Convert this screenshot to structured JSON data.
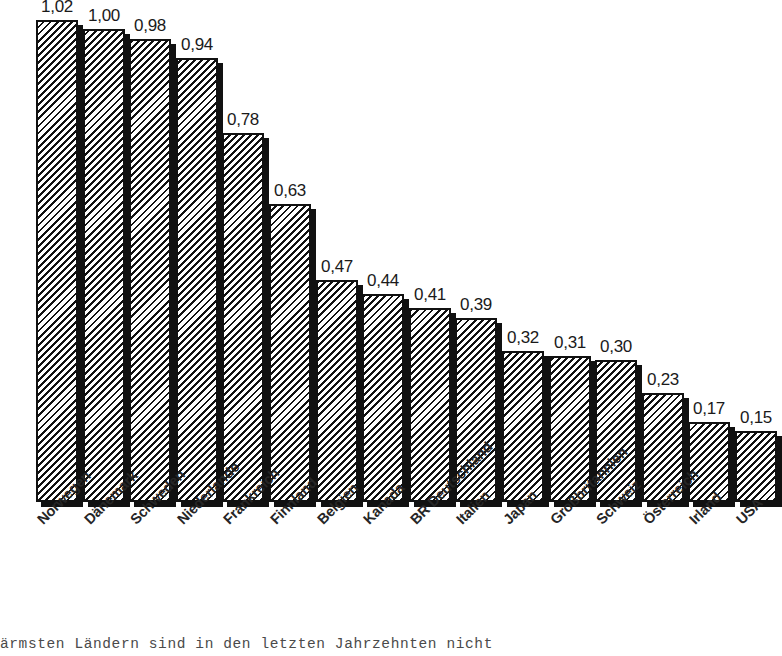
{
  "chart_data": {
    "type": "bar",
    "title": "",
    "subtitle": "",
    "xlabel": "",
    "ylabel": "",
    "ylim": [
      0,
      1.02
    ],
    "grid": false,
    "legend": "none",
    "value_decimal_separator": ",",
    "categories": [
      "Norwegen",
      "Dänemark",
      "Schweden",
      "Niederlande",
      "Frankreich",
      "Finnland",
      "Belgien",
      "Kanada",
      "BR Deutschland",
      "Italien",
      "Japan",
      "Großbritannien",
      "Schweiz",
      "Österreich",
      "Irland",
      "USA"
    ],
    "values": [
      1.02,
      1.0,
      0.98,
      0.94,
      0.78,
      0.63,
      0.47,
      0.44,
      0.41,
      0.39,
      0.32,
      0.31,
      0.3,
      0.23,
      0.17,
      0.15
    ],
    "value_labels": [
      "1,02",
      "1,00",
      "0,98",
      "0,94",
      "0,78",
      "0,63",
      "0,47",
      "0,44",
      "0,41",
      "0,39",
      "0,32",
      "0,31",
      "0,30",
      "0,23",
      "0,17",
      "0,15"
    ],
    "bar_style": {
      "fill": "diagonal-hatch",
      "outline": "#111111",
      "shadow": "#111111",
      "background": "#ffffff"
    }
  },
  "caption": {
    "text": "ärmsten Ländern sind in den letzten Jahrzehnten nicht"
  }
}
